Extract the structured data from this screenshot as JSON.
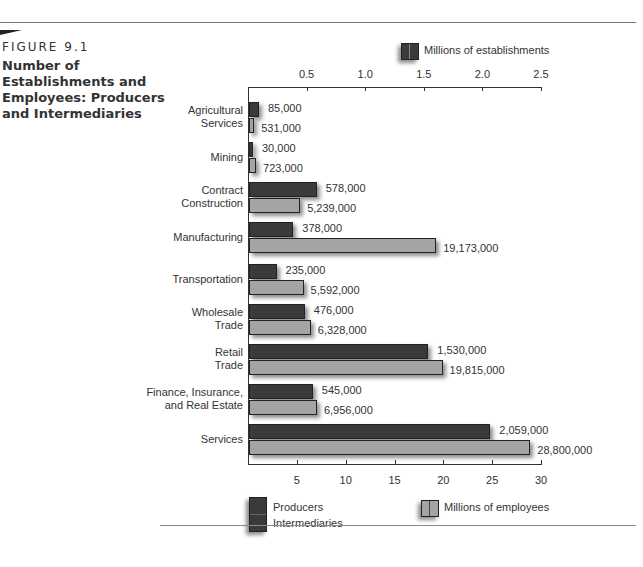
{
  "figure": {
    "label": "FIGURE 9.1",
    "title": "Number of Establishments and Employees: Producers and Intermediaries"
  },
  "legend": {
    "establishments": "Millions of establishments",
    "employees": "Millions of employees",
    "producers": "Producers",
    "intermediaries": "Intermediaries"
  },
  "axes": {
    "top_ticks": [
      "0.5",
      "1.0",
      "1.5",
      "2.0",
      "2.5"
    ],
    "bottom_ticks": [
      "5",
      "10",
      "15",
      "20",
      "25",
      "30"
    ]
  },
  "colors": {
    "establishments_bar": "#3a3a3a",
    "employees_bar": "#a4a4a4"
  },
  "chart_data": {
    "type": "bar",
    "orientation": "horizontal",
    "title": "Number of Establishments and Employees: Producers and Intermediaries",
    "categories": [
      "Agricultural Services",
      "Mining",
      "Contract Construction",
      "Manufacturing",
      "Transportation",
      "Wholesale Trade",
      "Retail Trade",
      "Finance, Insurance, and Real Estate",
      "Services"
    ],
    "series": [
      {
        "name": "Millions of establishments",
        "axis": "top",
        "values": [
          85000,
          30000,
          578000,
          378000,
          235000,
          476000,
          1530000,
          545000,
          2059000
        ],
        "labels": [
          "85,000",
          "30,000",
          "578,000",
          "378,000",
          "235,000",
          "476,000",
          "1,530,000",
          "545,000",
          "2,059,000"
        ]
      },
      {
        "name": "Millions of employees",
        "axis": "bottom",
        "values": [
          531000,
          723000,
          5239000,
          19173000,
          5592000,
          6328000,
          19815000,
          6956000,
          28800000
        ],
        "labels": [
          "531,000",
          "723,000",
          "5,239,000",
          "19,173,000",
          "5,592,000",
          "6,328,000",
          "19,815,000",
          "6,956,000",
          "28,800,000"
        ]
      }
    ],
    "top_axis": {
      "label": "Millions of establishments",
      "range": [
        0,
        2.5
      ],
      "ticks": [
        0.5,
        1.0,
        1.5,
        2.0,
        2.5
      ]
    },
    "bottom_axis": {
      "label": "Millions of employees",
      "range": [
        0,
        30
      ],
      "ticks": [
        5,
        10,
        15,
        20,
        25,
        30
      ]
    },
    "legend": [
      "Producers",
      "Intermediaries",
      "Millions of establishments",
      "Millions of employees"
    ],
    "grid": false
  }
}
